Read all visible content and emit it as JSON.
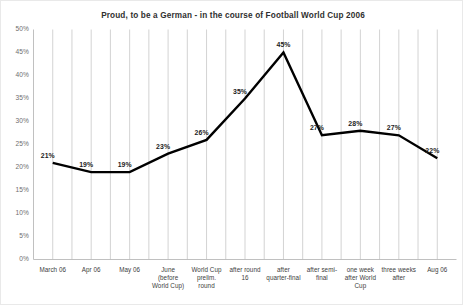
{
  "chart_data": {
    "type": "line",
    "title": "Proud, to be a German - in the course of Football World Cup 2006",
    "xlabel": "",
    "ylabel": "",
    "ylim": [
      0,
      50
    ],
    "yunit": "%",
    "ytick_labels": [
      "50%",
      "45%",
      "40%",
      "35%",
      "30%",
      "25%",
      "20%",
      "15%",
      "10%",
      "5%",
      "0%"
    ],
    "ytick_values": [
      50,
      45,
      40,
      35,
      30,
      25,
      20,
      15,
      10,
      5,
      0
    ],
    "grid": "vertical-only",
    "legend": "none",
    "line_color": "#000000",
    "gridline_color": "#c8c8c8",
    "categories": [
      "March 06",
      "Apr 06",
      "May 06",
      "June\n(before\nWorld Cup)",
      "World Cup\nprelim.\nround",
      "after round\n16",
      "after\nquarter-final",
      "after semi-\nfinal",
      "one week\nafter World\nCup",
      "three weeks\nafter",
      "Aug 06"
    ],
    "values": [
      21,
      19,
      19,
      23,
      26,
      35,
      45,
      27,
      28,
      27,
      22
    ],
    "data_labels": [
      "21%",
      "19%",
      "19%",
      "23%",
      "26%",
      "35%",
      "45%",
      "27%",
      "28%",
      "27%",
      "22%"
    ]
  }
}
